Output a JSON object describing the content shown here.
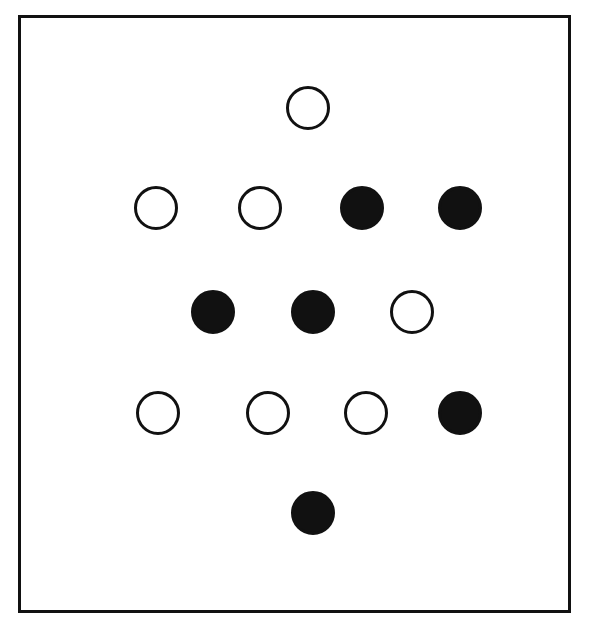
{
  "figure": {
    "colors": {
      "stroke": "#111111",
      "fill": "#111111",
      "background": "#ffffff"
    },
    "circles": [
      {
        "row": 1,
        "x": 308,
        "y": 108,
        "type": "open"
      },
      {
        "row": 2,
        "x": 156,
        "y": 208,
        "type": "open"
      },
      {
        "row": 2,
        "x": 260,
        "y": 208,
        "type": "open"
      },
      {
        "row": 2,
        "x": 362,
        "y": 208,
        "type": "filled"
      },
      {
        "row": 2,
        "x": 460,
        "y": 208,
        "type": "filled"
      },
      {
        "row": 3,
        "x": 213,
        "y": 312,
        "type": "filled"
      },
      {
        "row": 3,
        "x": 313,
        "y": 312,
        "type": "filled"
      },
      {
        "row": 3,
        "x": 412,
        "y": 312,
        "type": "open"
      },
      {
        "row": 4,
        "x": 158,
        "y": 413,
        "type": "open"
      },
      {
        "row": 4,
        "x": 268,
        "y": 413,
        "type": "open"
      },
      {
        "row": 4,
        "x": 366,
        "y": 413,
        "type": "open"
      },
      {
        "row": 4,
        "x": 460,
        "y": 413,
        "type": "filled"
      },
      {
        "row": 5,
        "x": 313,
        "y": 513,
        "type": "filled"
      }
    ],
    "counts": {
      "open": 7,
      "filled": 6,
      "total": 13
    }
  }
}
